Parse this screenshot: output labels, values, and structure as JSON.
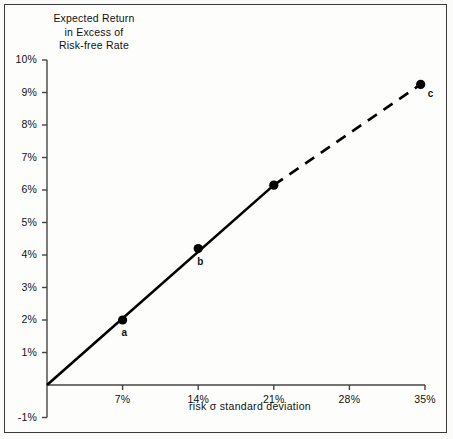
{
  "chart_data": {
    "type": "line",
    "title": "Expected Return in Excess of Risk-free Rate",
    "title_lines": [
      "Expected Return",
      "in Excess of",
      "Risk-free Rate"
    ],
    "xlabel": "risk σ standard deviation",
    "ylabel": "Expected Return in Excess of Risk-free Rate",
    "xlim": [
      0,
      35
    ],
    "ylim": [
      -1,
      10
    ],
    "grid": false,
    "legend": "none",
    "xticks": [
      7,
      14,
      21,
      28,
      35
    ],
    "xtick_labels": [
      "7%",
      "14%",
      "21%",
      "28%",
      "35%"
    ],
    "yticks": [
      -1,
      1,
      2,
      3,
      4,
      5,
      6,
      7,
      8,
      9,
      10
    ],
    "ytick_labels": [
      "-1%",
      "1%",
      "2%",
      "3%",
      "4%",
      "5%",
      "6%",
      "7%",
      "8%",
      "9%",
      "10%"
    ],
    "series": [
      {
        "name": "Capital market line (solid)",
        "style": "solid",
        "x": [
          0,
          21
        ],
        "y": [
          0,
          6.15
        ]
      },
      {
        "name": "Capital market line (extrapolated, dashed)",
        "style": "dashed",
        "x": [
          21,
          34.6
        ],
        "y": [
          6.15,
          9.25
        ]
      }
    ],
    "points": [
      {
        "label": "a",
        "x": 7,
        "y": 2.0
      },
      {
        "label": "b",
        "x": 14,
        "y": 4.2
      },
      {
        "label": "",
        "x": 21,
        "y": 6.15
      },
      {
        "label": "c",
        "x": 34.6,
        "y": 9.25
      }
    ],
    "slope_per_unit_sigma": 0.267,
    "intercept": 0
  },
  "colors": {
    "line": "#000000",
    "axis": "#444444",
    "text": "#111111",
    "frame": "#3a3a3a",
    "background": "#fdfdfc"
  }
}
